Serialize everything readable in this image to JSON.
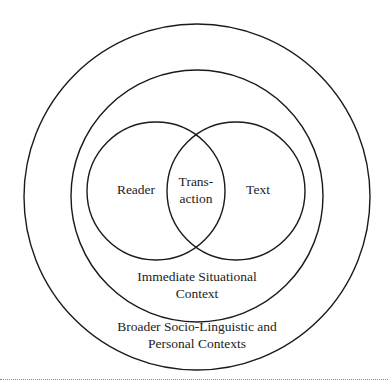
{
  "diagram": {
    "type": "nested-venn",
    "circles": {
      "broader_context": {
        "cx": 197,
        "cy": 197,
        "r": 173
      },
      "situational_context": {
        "cx": 197,
        "cy": 196,
        "r": 126
      },
      "reader": {
        "cx": 156,
        "cy": 191,
        "r": 69
      },
      "text": {
        "cx": 236,
        "cy": 191,
        "r": 69
      }
    },
    "labels": {
      "reader": "Reader",
      "transaction_line1": "Trans-",
      "transaction_line2": "action",
      "text": "Text",
      "situational_line1": "Immediate Situational",
      "situational_line2": "Context",
      "broader_line1": "Broader Socio-Linguistic and",
      "broader_line2": "Personal Contexts"
    },
    "stroke_color": "#1a1a1a",
    "background": "#ffffff"
  }
}
